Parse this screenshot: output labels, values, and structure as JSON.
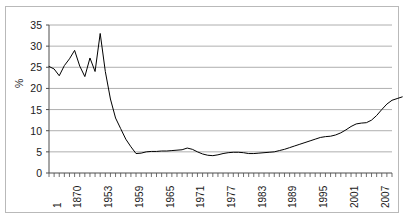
{
  "chart_data": {
    "type": "line",
    "title": "",
    "xlabel": "",
    "ylabel": "%",
    "ylim": [
      0,
      35
    ],
    "ytick_values": [
      0,
      5,
      10,
      15,
      20,
      25,
      30,
      35
    ],
    "ytick_labels": [
      "0",
      "5",
      "10",
      "15",
      "20",
      "25",
      "30",
      "35"
    ],
    "grid": "horizontal",
    "legend": "none",
    "xtick_labels": [
      "1",
      "1870",
      "1953",
      "1959",
      "1965",
      "1971",
      "1977",
      "1983",
      "1989",
      "1995",
      "2001",
      "2007"
    ],
    "xtick_indices": [
      0,
      4,
      10,
      16,
      22,
      28,
      34,
      40,
      46,
      52,
      58,
      64
    ],
    "n_points": 68,
    "series": [
      {
        "name": "percent",
        "color": "#000000",
        "values": [
          25.2,
          24.6,
          23.0,
          25.4,
          27.0,
          29.0,
          25.3,
          22.8,
          27.2,
          24.0,
          33.0,
          24.0,
          17.5,
          13.0,
          10.5,
          8.0,
          6.2,
          4.6,
          4.7,
          5.0,
          5.1,
          5.1,
          5.2,
          5.2,
          5.3,
          5.4,
          5.5,
          5.9,
          5.6,
          5.0,
          4.5,
          4.2,
          4.1,
          4.3,
          4.6,
          4.8,
          4.9,
          4.9,
          4.8,
          4.6,
          4.6,
          4.7,
          4.8,
          4.9,
          5.0,
          5.3,
          5.6,
          6.0,
          6.4,
          6.8,
          7.2,
          7.6,
          8.0,
          8.4,
          8.6,
          8.7,
          9.0,
          9.5,
          10.2,
          11.0,
          11.6,
          11.8,
          11.9,
          12.5,
          13.6,
          15.0,
          16.3,
          17.2,
          17.6,
          18.0
        ]
      }
    ]
  },
  "axes_geometry": {
    "plot_left": 49,
    "plot_right": 392,
    "plot_top": 25,
    "plot_bottom": 173
  }
}
